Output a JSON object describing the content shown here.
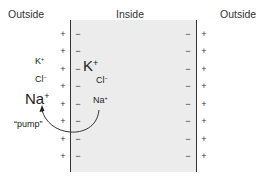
{
  "labels": {
    "outside_left": "Outside",
    "inside": "Inside",
    "outside_right": "Outside",
    "pump": "“pump”"
  },
  "membrane_signs": {
    "outer_face": "+",
    "inner_face": "−",
    "rows": 8
  },
  "ions": {
    "outside": [
      {
        "symbol": "K",
        "charge": "+",
        "size": "small"
      },
      {
        "symbol": "Cl",
        "charge": "−",
        "size": "small"
      },
      {
        "symbol": "Na",
        "charge": "+",
        "size": "large"
      }
    ],
    "inside": [
      {
        "symbol": "K",
        "charge": "+",
        "size": "large"
      },
      {
        "symbol": "Cl",
        "charge": "−",
        "size": "small"
      },
      {
        "symbol": "Na",
        "charge": "+",
        "size": "small"
      }
    ]
  },
  "colors": {
    "inside_fill": "#ececec",
    "line": "#333333"
  }
}
